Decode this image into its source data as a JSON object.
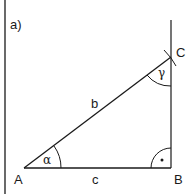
{
  "figure": {
    "panel_label": "a)",
    "vertices": {
      "A": "A",
      "B": "B",
      "C": "C"
    },
    "sides": {
      "b": "b",
      "c": "c"
    },
    "angles": {
      "alpha": "α",
      "gamma": "γ"
    },
    "right_angle_marker": "•",
    "colors": {
      "line": "#1a1a1a",
      "background": "#ffffff"
    }
  }
}
